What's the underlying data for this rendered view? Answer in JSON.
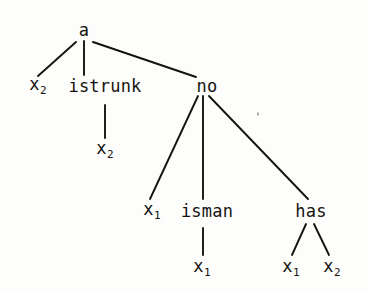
{
  "diagram": {
    "type": "tree",
    "background_color": "#fdfdfc",
    "ink_color": "#15130f",
    "nodes": [
      {
        "id": "a",
        "label": "a",
        "base": "a",
        "subscript": "",
        "x": 84,
        "y": 30,
        "level": 0
      },
      {
        "id": "x2_l",
        "label": "x2",
        "base": "x",
        "subscript": "2",
        "x": 38,
        "y": 86,
        "level": 1
      },
      {
        "id": "istrunk",
        "label": "istrunk",
        "base": "istrunk",
        "subscript": "",
        "x": 105,
        "y": 86,
        "level": 1
      },
      {
        "id": "no",
        "label": "no",
        "base": "no",
        "subscript": "",
        "x": 207,
        "y": 86,
        "level": 1
      },
      {
        "id": "x2_c",
        "label": "x2",
        "base": "x",
        "subscript": "2",
        "x": 105,
        "y": 150,
        "level": 2
      },
      {
        "id": "x1_a",
        "label": "x1",
        "base": "x",
        "subscript": "1",
        "x": 152,
        "y": 211,
        "level": 2
      },
      {
        "id": "isman",
        "label": "isman",
        "base": "isman",
        "subscript": "",
        "x": 207,
        "y": 211,
        "level": 2
      },
      {
        "id": "has",
        "label": "has",
        "base": "has",
        "subscript": "",
        "x": 311,
        "y": 211,
        "level": 2
      },
      {
        "id": "x1_b",
        "label": "x1",
        "base": "x",
        "subscript": "1",
        "x": 202,
        "y": 268,
        "level": 3
      },
      {
        "id": "x1_c",
        "label": "x1",
        "base": "x",
        "subscript": "1",
        "x": 291,
        "y": 268,
        "level": 3
      },
      {
        "id": "x2_r",
        "label": "x2",
        "base": "x",
        "subscript": "2",
        "x": 332,
        "y": 268,
        "level": 3
      }
    ],
    "edges": [
      {
        "id": "a-x2",
        "from": "a",
        "to": "x2_l",
        "x1": 76,
        "y1": 42,
        "x2": 38,
        "y2": 76
      },
      {
        "id": "a-istrunk",
        "from": "a",
        "to": "istrunk",
        "x1": 84,
        "y1": 41,
        "x2": 84,
        "y2": 75
      },
      {
        "id": "a-no",
        "from": "a",
        "to": "no",
        "x1": 93,
        "y1": 42,
        "x2": 196,
        "y2": 77
      },
      {
        "id": "istrunk-x2",
        "from": "istrunk",
        "to": "x2_c",
        "x1": 105,
        "y1": 105,
        "x2": 105,
        "y2": 138
      },
      {
        "id": "no-x1",
        "from": "no",
        "to": "x1_a",
        "x1": 198,
        "y1": 96,
        "x2": 150,
        "y2": 199
      },
      {
        "id": "no-isman",
        "from": "no",
        "to": "isman",
        "x1": 203,
        "y1": 96,
        "x2": 203,
        "y2": 199
      },
      {
        "id": "no-has",
        "from": "no",
        "to": "has",
        "x1": 209,
        "y1": 96,
        "x2": 308,
        "y2": 199
      },
      {
        "id": "isman-x1",
        "from": "isman",
        "to": "x1_b",
        "x1": 203,
        "y1": 228,
        "x2": 203,
        "y2": 255
      },
      {
        "id": "has-x1",
        "from": "has",
        "to": "x1_c",
        "x1": 306,
        "y1": 224,
        "x2": 292,
        "y2": 255
      },
      {
        "id": "has-x2",
        "from": "has",
        "to": "x2_r",
        "x1": 314,
        "y1": 224,
        "x2": 329,
        "y2": 255
      }
    ],
    "artifacts": [
      {
        "id": "speck-1",
        "x": 258,
        "y": 114
      }
    ]
  }
}
